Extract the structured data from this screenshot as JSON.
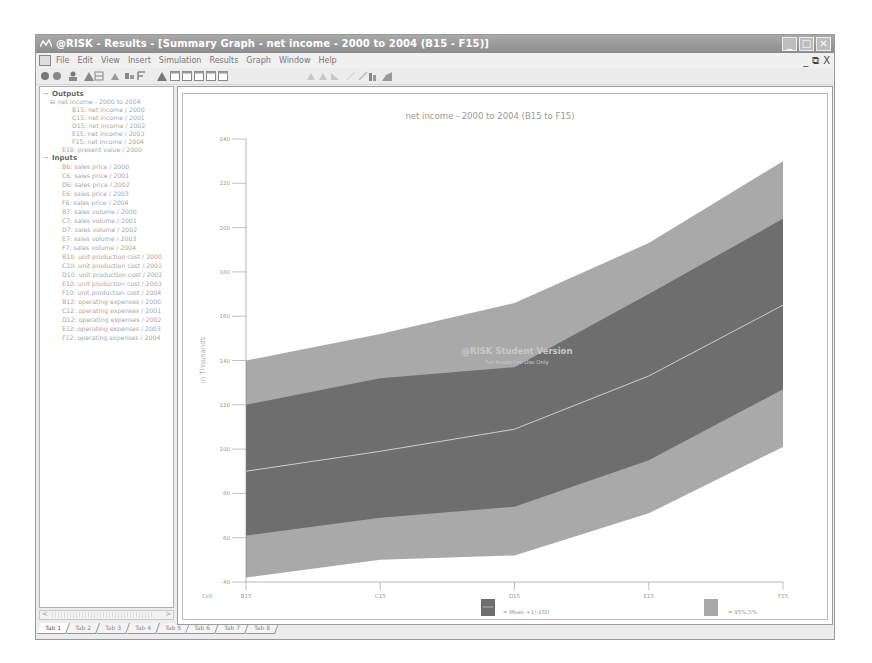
{
  "window": {
    "title": "@RISK - Results - [Summary Graph - net income - 2000 to 2004 (B15 - F15)]",
    "controls": [
      "minimize",
      "maximize",
      "close"
    ]
  },
  "menubar": {
    "items": [
      "File",
      "Edit",
      "View",
      "Insert",
      "Simulation",
      "Results",
      "Graph",
      "Window",
      "Help"
    ],
    "mdi_controls": [
      "_",
      "⧉",
      "X"
    ]
  },
  "toolbar": {
    "icons": [
      "open-icon",
      "save-icon",
      "users-icon",
      "chart-icon",
      "table-icon",
      "triangle-icon",
      "sensitivity-icon",
      "scenario-icon",
      "graph-icon",
      "window-icon",
      "window-icon",
      "window-icon",
      "window-icon",
      "window-icon",
      "histogram-icon",
      "histogram-icon",
      "histogram-icon",
      "line-icon",
      "line-icon",
      "bar-icon",
      "area-icon"
    ]
  },
  "tree": {
    "outputs_label": "Outputs",
    "outputs_group": "net income - 2000 to 2004",
    "outputs": [
      "B15: net income / 2000",
      "C15: net income / 2001",
      "D15: net income / 2002",
      "E15: net income / 2003",
      "F15: net income / 2004"
    ],
    "output_extra": "E18: present value / 2000",
    "inputs_label": "Inputs",
    "inputs": [
      "B6: sales price / 2000",
      "C6: sales price / 2001",
      "D6: sales price / 2002",
      "E6: sales price / 2003",
      "F6: sales price / 2004",
      "B7: sales volume / 2000",
      "C7: sales volume / 2001",
      "D7: sales volume / 2002",
      "E7: sales volume / 2003",
      "F7: sales volume / 2004",
      "B10: unit production cost / 2000",
      "C10: unit production cost / 2001",
      "D10: unit production cost / 2002",
      "E10: unit production cost / 2003",
      "F10: unit production cost / 2004",
      "B12: operating expenses / 2000",
      "C12: operating expenses / 2001",
      "D12: operating expenses / 2002",
      "E12: operating expenses / 2003",
      "F12: operating expenses / 2004"
    ]
  },
  "tabs": [
    "Tab 1",
    "Tab 2",
    "Tab 3",
    "Tab 4",
    "Tab 5",
    "Tab 6",
    "Tab 7",
    "Tab 8"
  ],
  "watermark": {
    "line1": "@RISK Student Version",
    "line2": "For Academic Use Only"
  },
  "colors": {
    "outer_band": "#a9a9a9",
    "inner_band": "#6e6e6e",
    "mean_line": "#d8d8d8",
    "title_bar": "#999999"
  },
  "chart_data": {
    "type": "area",
    "title": "net income - 2000 to 2004 (B15 to F15)",
    "xlabel": "Cell",
    "ylabel": "in Thousands",
    "categories": [
      "B15",
      "C15",
      "D15",
      "E15",
      "F15"
    ],
    "ylim": [
      40,
      240
    ],
    "yticks": [
      40,
      60,
      80,
      100,
      120,
      140,
      160,
      180,
      200,
      220,
      240
    ],
    "grid": false,
    "series": [
      {
        "name": "95%",
        "values": [
          140,
          152,
          166,
          193,
          230
        ]
      },
      {
        "name": "Mean +1SD",
        "values": [
          120,
          132,
          137,
          170,
          204
        ]
      },
      {
        "name": "Mean",
        "values": [
          90,
          99,
          109,
          133,
          165
        ]
      },
      {
        "name": "Mean -1SD",
        "values": [
          61,
          69,
          74,
          95,
          127
        ]
      },
      {
        "name": "5%",
        "values": [
          42,
          50,
          52,
          71,
          101
        ]
      }
    ],
    "legend": [
      {
        "label": "= Mean +1/-1SD",
        "swatch": "inner"
      },
      {
        "label": "= 95%,5%",
        "swatch": "outer"
      }
    ],
    "legend_position": "bottom"
  }
}
